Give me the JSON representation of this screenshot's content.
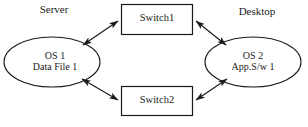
{
  "diagram": {
    "stroke_color": "#1a1a1a",
    "fill_color": "#ffffff",
    "captions": [
      {
        "name": "server",
        "text": "Server"
      },
      {
        "name": "desktop",
        "text": "Desktop"
      }
    ],
    "nodes": [
      {
        "id": "server-host",
        "shape": "ellipse",
        "lines": [
          "OS 1",
          "Data File 1"
        ]
      },
      {
        "id": "switch1",
        "shape": "rectangle",
        "lines": [
          "Switch1"
        ]
      },
      {
        "id": "switch2",
        "shape": "rectangle",
        "lines": [
          "Switch2"
        ]
      },
      {
        "id": "desktop-host",
        "shape": "ellipse",
        "lines": [
          "OS 2",
          "App.S/w 1"
        ]
      }
    ],
    "connections": [
      {
        "from": "server-host",
        "to": "switch1",
        "arrow": "double"
      },
      {
        "from": "switch1",
        "to": "desktop-host",
        "arrow": "double"
      },
      {
        "from": "server-host",
        "to": "switch2",
        "arrow": "double"
      },
      {
        "from": "switch2",
        "to": "desktop-host",
        "arrow": "double"
      }
    ]
  }
}
